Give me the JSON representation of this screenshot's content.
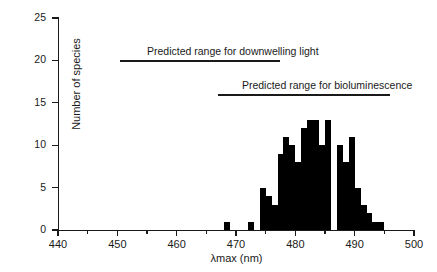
{
  "chart_data": {
    "type": "bar",
    "title": "",
    "subtitle": "",
    "xlabel": "λmax (nm)",
    "ylabel": "Number of species",
    "xlim": [
      440,
      500
    ],
    "ylim": [
      0,
      25
    ],
    "grid": false,
    "legend_position": "none",
    "bin_width": 1,
    "x_major_ticks": [
      440,
      450,
      460,
      470,
      480,
      490,
      500
    ],
    "x_minor_ticks": [
      445,
      455,
      465,
      475,
      485,
      495
    ],
    "x_tick_labels": [
      "440",
      "450",
      "460",
      "470",
      "480",
      "490",
      "500"
    ],
    "y_ticks": [
      0,
      5,
      10,
      15,
      20,
      25
    ],
    "y_tick_labels": [
      "0",
      "5",
      "10",
      "15",
      "20",
      "25"
    ],
    "bar_color": "#000000",
    "axis_color": "#1a1a1a",
    "x": [
      468,
      472,
      474,
      475,
      476,
      477,
      478,
      479,
      480,
      481,
      482,
      483,
      484,
      485,
      486,
      487,
      488,
      489,
      490,
      491,
      492,
      493,
      494
    ],
    "values": [
      1,
      1,
      5,
      4,
      3,
      9,
      11,
      10,
      8,
      12,
      13,
      13,
      10,
      13,
      0,
      10,
      8,
      11,
      5,
      3,
      2,
      1,
      1
    ],
    "categories": [
      "468",
      "472",
      "474",
      "475",
      "476",
      "477",
      "478",
      "479",
      "480",
      "481",
      "482",
      "483",
      "484",
      "485",
      "486",
      "487",
      "488",
      "489",
      "490",
      "491",
      "492",
      "493",
      "494"
    ],
    "annotations": [
      {
        "name": "downwelling-light-range",
        "label": "Predicted range for downwelling light",
        "x_start": 450.5,
        "x_end": 477.5,
        "y_level": 20,
        "label_x": 455
      },
      {
        "name": "bioluminescence-range",
        "label": "Predicted range for bioluminescence",
        "x_start": 467,
        "x_end": 496,
        "y_level": 16,
        "label_x": 471
      }
    ]
  },
  "axes": {
    "x_title": "λmax (nm)",
    "y_title": "Number of species",
    "x_labels": [
      "440",
      "450",
      "460",
      "470",
      "480",
      "490",
      "500"
    ],
    "y_labels": [
      "0",
      "5",
      "10",
      "15",
      "20",
      "25"
    ]
  },
  "annotations": {
    "downwelling": "Predicted range for downwelling light",
    "bioluminescence": "Predicted range for bioluminescence"
  }
}
